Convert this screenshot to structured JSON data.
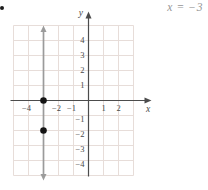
{
  "equation": {
    "text": "x = −3"
  },
  "chart_data": {
    "type": "line",
    "title": "",
    "equation": "x = −3",
    "x_axis_label": "x",
    "y_axis_label": "y",
    "x_range": [
      -5,
      3
    ],
    "y_range": [
      -5,
      5
    ],
    "grid": true,
    "x_ticks": [
      {
        "value": -4,
        "label": "−4"
      },
      {
        "value": -2,
        "label": "−2"
      },
      {
        "value": -1,
        "label": "−1"
      },
      {
        "value": 1,
        "label": "1"
      },
      {
        "value": 2,
        "label": "2"
      }
    ],
    "y_ticks": [
      {
        "value": 4,
        "label": "4"
      },
      {
        "value": 3,
        "label": "3"
      },
      {
        "value": 2,
        "label": "2"
      },
      {
        "value": 1,
        "label": "1"
      },
      {
        "value": -1,
        "label": "−1"
      },
      {
        "value": -2,
        "label": "−2"
      },
      {
        "value": -3,
        "label": "−3"
      },
      {
        "value": -4,
        "label": "−4"
      }
    ],
    "line": {
      "orientation": "vertical",
      "x": -3,
      "arrow_both_ends": true
    },
    "points": [
      {
        "x": -3,
        "y": 0
      },
      {
        "x": -3,
        "y": -2
      }
    ],
    "colors": {
      "grid": "#e7ddd9",
      "axis": "#4c4c4c",
      "line": "#9b9b9b",
      "point": "#141414",
      "equation_text": "#969696"
    }
  }
}
